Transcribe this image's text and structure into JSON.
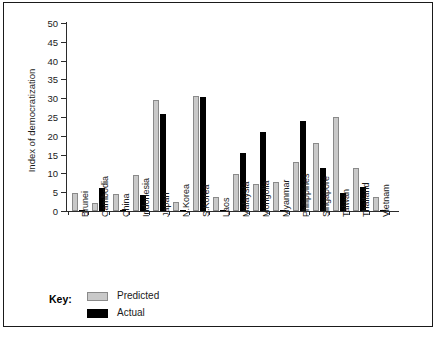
{
  "chart_data": {
    "type": "bar",
    "title": "",
    "xlabel": "",
    "ylabel": "Index of democratization",
    "ylim": [
      0,
      50
    ],
    "yticks": [
      0,
      5,
      10,
      15,
      20,
      25,
      30,
      35,
      40,
      45,
      50
    ],
    "grid": false,
    "legend_position": "bottom-left",
    "legend_title": "Key:",
    "categories": [
      "Brunei",
      "Cambodia",
      "China",
      "Indonesia",
      "Japan",
      "N.Korea",
      "S.Korea",
      "Laos",
      "Malaysia",
      "Mongolia",
      "Myanmar",
      "Philippines",
      "Singapore",
      "Taiwan",
      "Thailand",
      "Vietnam"
    ],
    "series": [
      {
        "name": "Predicted",
        "color": "#c9c9c9",
        "values": [
          4.8,
          2.0,
          4.5,
          9.5,
          29.5,
          2.5,
          30.7,
          3.7,
          9.8,
          7.1,
          7.6,
          13.1,
          18.0,
          25.0,
          11.5,
          3.7
        ]
      },
      {
        "name": "Actual",
        "color": "#000000",
        "values": [
          0.3,
          6.2,
          0.4,
          4.3,
          25.8,
          0.3,
          30.3,
          0.3,
          15.3,
          21.1,
          0.3,
          23.9,
          11.4,
          4.8,
          6.5,
          0.2
        ]
      }
    ]
  }
}
